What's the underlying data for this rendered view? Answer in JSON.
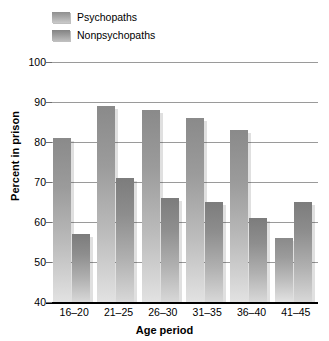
{
  "chart_data": {
    "type": "bar",
    "title": "",
    "xlabel": "Age period",
    "ylabel": "Percent in prison",
    "categories": [
      "16–20",
      "21–25",
      "26–30",
      "31–35",
      "36–40",
      "41–45"
    ],
    "series": [
      {
        "name": "Psychopaths",
        "values": [
          81,
          89,
          88,
          86,
          83,
          56
        ],
        "color": "#a0a0a0"
      },
      {
        "name": "Nonpsychopaths",
        "values": [
          57,
          71,
          66,
          65,
          61,
          65
        ],
        "color": "#909090"
      }
    ],
    "ylim": [
      40,
      100
    ],
    "yticks": [
      40,
      50,
      60,
      70,
      80,
      90,
      100
    ],
    "ytick_labels": [
      "40",
      "50",
      "60",
      "70",
      "80",
      "90",
      "100"
    ],
    "grid": true,
    "legend_position": "top-left"
  },
  "legend": {
    "items": [
      {
        "label": "Psychopaths"
      },
      {
        "label": "Nonpsychopaths"
      }
    ]
  },
  "axes": {
    "x_title": "Age period",
    "y_title": "Percent in prison"
  }
}
